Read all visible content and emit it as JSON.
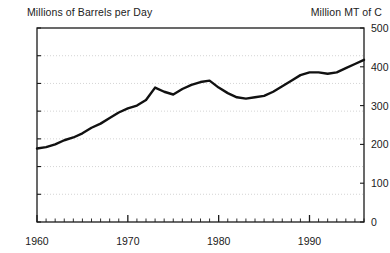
{
  "chart_data": {
    "type": "line",
    "title": "",
    "title_left": "Millions of Barrels per Day",
    "title_right": "Million MT of C",
    "xlabel": "",
    "ylabel": "Millions of Barrels per Day",
    "ylabel_right": "Million MT of C",
    "xlim": [
      1960,
      1996
    ],
    "ylim": [
      0,
      14
    ],
    "ylim_right": [
      0,
      500
    ],
    "grid": "horizontal-dotted",
    "legend": "none",
    "x_major_ticks": [
      1960,
      1970,
      1980,
      1990
    ],
    "x_major_tick_labels": [
      "1960",
      "1970",
      "1980",
      "1990"
    ],
    "x_minor_tick_step": 1,
    "y_left_ticks": [
      0,
      2,
      4,
      6,
      8,
      10,
      12,
      14
    ],
    "y_left_tick_labels": [
      "0",
      "2",
      "4",
      "6",
      "8",
      "10",
      "12",
      "14"
    ],
    "y_right_ticks": [
      0,
      100,
      200,
      300,
      400,
      500
    ],
    "y_right_tick_labels": [
      "0",
      "100",
      "200",
      "300",
      "400",
      "500"
    ],
    "x_axis_end_labels": [
      "0",
      "0"
    ],
    "line_color": "#111111",
    "line_width": 2.4,
    "grid_color": "#cfcfcf",
    "frame_color": "#1a1a1a",
    "series": [
      {
        "name": "World oil consumption",
        "x": [
          1960,
          1961,
          1962,
          1963,
          1964,
          1965,
          1966,
          1967,
          1968,
          1969,
          1970,
          1971,
          1972,
          1973,
          1974,
          1975,
          1976,
          1977,
          1978,
          1979,
          1980,
          1981,
          1982,
          1983,
          1984,
          1985,
          1986,
          1987,
          1988,
          1989,
          1990,
          1991,
          1992,
          1993,
          1994,
          1995,
          1996
        ],
        "values": [
          5.3,
          5.4,
          5.6,
          5.9,
          6.1,
          6.4,
          6.8,
          7.1,
          7.5,
          7.9,
          8.2,
          8.4,
          8.8,
          9.7,
          9.4,
          9.2,
          9.6,
          9.9,
          10.1,
          10.2,
          9.7,
          9.3,
          9.0,
          8.9,
          9.0,
          9.1,
          9.4,
          9.8,
          10.2,
          10.6,
          10.8,
          10.8,
          10.7,
          10.8,
          11.1,
          11.4,
          11.7
        ]
      }
    ],
    "annotations": []
  }
}
